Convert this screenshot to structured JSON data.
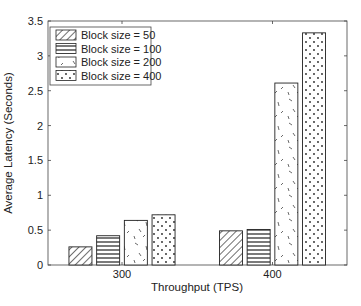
{
  "chart_data": {
    "type": "bar",
    "title": "",
    "xlabel": "Throughput (TPS)",
    "ylabel": "Average Latency (Seconds)",
    "categories": [
      "300",
      "400"
    ],
    "series": [
      {
        "name": "Block size = 50",
        "pattern": "diagonal-hatch",
        "values": [
          0.26,
          0.49
        ]
      },
      {
        "name": "Block size = 100",
        "pattern": "horizontal-lines",
        "values": [
          0.42,
          0.51
        ]
      },
      {
        "name": "Block size = 200",
        "pattern": "random-dashes",
        "values": [
          0.64,
          2.61
        ]
      },
      {
        "name": "Block size = 400",
        "pattern": "dots",
        "values": [
          0.72,
          3.33
        ]
      }
    ],
    "ylim": [
      0,
      3.5
    ],
    "yticks": [
      "0",
      "0.5",
      "1",
      "1.5",
      "2",
      "2.5",
      "3",
      "3.5"
    ],
    "ytick_values": [
      0,
      0.5,
      1,
      1.5,
      2,
      2.5,
      3,
      3.5
    ],
    "grid": false,
    "legend_position": "upper-left",
    "colors": {
      "edge": "#222222",
      "fill": "#ffffff"
    }
  }
}
